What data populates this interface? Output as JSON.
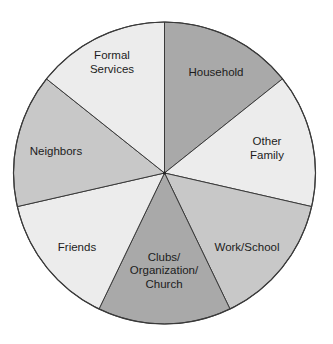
{
  "chart_data": {
    "type": "pie",
    "title": "",
    "start_angle_deg": 0,
    "direction": "clockwise",
    "categories": [
      "Household",
      "Other Family",
      "Work/School",
      "Clubs/ Organization/ Church",
      "Friends",
      "Neighbors",
      "Formal Services"
    ],
    "values": [
      14.3,
      14.3,
      14.3,
      14.3,
      14.3,
      14.3,
      14.3
    ],
    "colors": [
      "#a9a9a9",
      "#ececec",
      "#c8c8c8",
      "#a9a9a9",
      "#ececec",
      "#c8c8c8",
      "#ececec"
    ],
    "labels": [
      {
        "lines": [
          "Household"
        ],
        "x": 216,
        "y": 72
      },
      {
        "lines": [
          "Other",
          "Family"
        ],
        "x": 267,
        "y": 148
      },
      {
        "lines": [
          "Work/School"
        ],
        "x": 247,
        "y": 247
      },
      {
        "lines": [
          "Clubs/",
          "Organization/",
          "Church"
        ],
        "x": 164,
        "y": 270
      },
      {
        "lines": [
          "Friends"
        ],
        "x": 77,
        "y": 247
      },
      {
        "lines": [
          "Neighbors"
        ],
        "x": 56,
        "y": 151
      },
      {
        "lines": [
          "Formal",
          "Services"
        ],
        "x": 112,
        "y": 62
      }
    ],
    "legend": "none (labels inside slices)",
    "grid": false
  },
  "geometry": {
    "cx": 164.5,
    "cy": 173,
    "r": 151
  }
}
